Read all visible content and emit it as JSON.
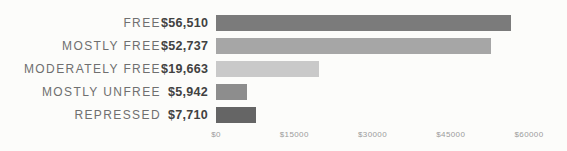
{
  "chart_data": {
    "type": "bar",
    "orientation": "horizontal",
    "categories": [
      "FREE",
      "MOSTLY FREE",
      "MODERATELY FREE",
      "MOSTLY UNFREE",
      "REPRESSED"
    ],
    "values": [
      56510,
      52737,
      19663,
      5942,
      7710
    ],
    "value_labels": [
      "$56,510",
      "$52,737",
      "$19,663",
      "$5,942",
      "$7,710"
    ],
    "xlim": [
      0,
      60000
    ],
    "x_ticks": [
      "$0",
      "$15000",
      "$30000",
      "$45000",
      "$60000"
    ],
    "x_tick_positions": [
      0,
      15000,
      30000,
      45000,
      60000
    ],
    "bar_colors": [
      "#7b7b7b",
      "#a6a6a6",
      "#c9c9c9",
      "#8d8d8d",
      "#656565"
    ],
    "grid": false,
    "legend": false
  },
  "colors": {
    "background": "#fcfcfa",
    "category_label": "#6f6f6f",
    "value_label": "#414141",
    "axis_label": "#9b9b9b"
  }
}
